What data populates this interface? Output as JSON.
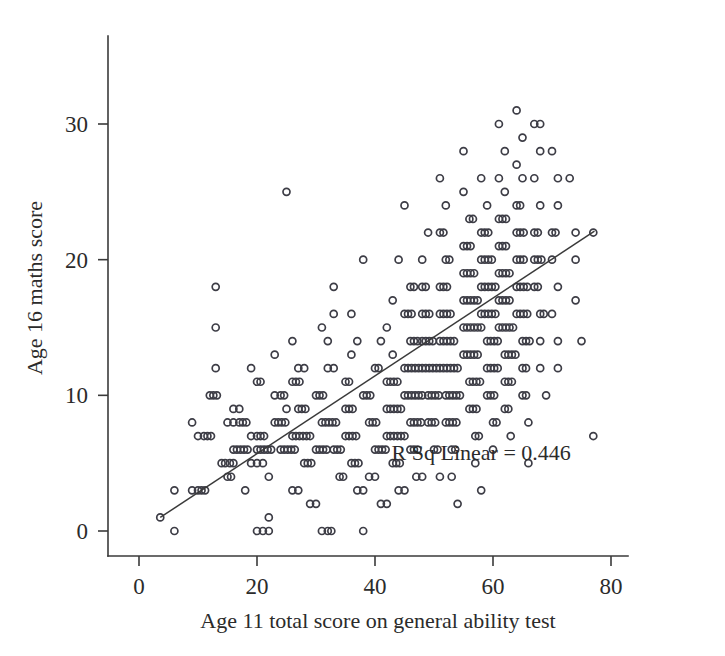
{
  "chart_data": {
    "type": "scatter",
    "title": "",
    "xlabel": "Age 11 total score on general ability test",
    "ylabel": "Age 16 maths score",
    "xlim": [
      -2,
      84
    ],
    "ylim": [
      -1.8,
      38
    ],
    "xticks": [
      0,
      20,
      40,
      60,
      80
    ],
    "xtick_labels": [
      "0",
      "20",
      "40",
      "60",
      "80"
    ],
    "yticks": [
      0,
      10,
      20,
      30
    ],
    "ytick_labels": [
      "0",
      "10",
      "20",
      "30"
    ],
    "grid": false,
    "legend": false,
    "marker": "open-circle",
    "marker_size": 7,
    "marker_color": "#3d3d46",
    "line_color": "#3a3a3a",
    "annotations": [
      {
        "text": "R Sq Linear = 0.446",
        "x": 58,
        "y": 5.2
      }
    ],
    "fit_line": {
      "type": "linear",
      "r_squared": 0.446,
      "x_start": 3.6,
      "y_start": 1.0,
      "x_end": 77.2,
      "y_end": 22.1
    },
    "points": [
      [
        3.6,
        1
      ],
      [
        6,
        0
      ],
      [
        6,
        3
      ],
      [
        9,
        3
      ],
      [
        10,
        3
      ],
      [
        10.6,
        3
      ],
      [
        11.2,
        3
      ],
      [
        13,
        18
      ],
      [
        13,
        15
      ],
      [
        9,
        8
      ],
      [
        10,
        7
      ],
      [
        11,
        7
      ],
      [
        11.6,
        7
      ],
      [
        12.2,
        7
      ],
      [
        12,
        10
      ],
      [
        12.6,
        10
      ],
      [
        13.2,
        10
      ],
      [
        13,
        12
      ],
      [
        14,
        5
      ],
      [
        14.6,
        5
      ],
      [
        15.4,
        5
      ],
      [
        16,
        5
      ],
      [
        15,
        4
      ],
      [
        15.6,
        4
      ],
      [
        16,
        6
      ],
      [
        16.6,
        6
      ],
      [
        17.2,
        6
      ],
      [
        17.8,
        6
      ],
      [
        18.4,
        6
      ],
      [
        15,
        8
      ],
      [
        16,
        8
      ],
      [
        17,
        8
      ],
      [
        17.6,
        8
      ],
      [
        18.2,
        8
      ],
      [
        16,
        9
      ],
      [
        17,
        9
      ],
      [
        20,
        0
      ],
      [
        21,
        0
      ],
      [
        22,
        0
      ],
      [
        19,
        12
      ],
      [
        20,
        11
      ],
      [
        20.6,
        11
      ],
      [
        20,
        6
      ],
      [
        20.6,
        6
      ],
      [
        21.2,
        6
      ],
      [
        21.8,
        6
      ],
      [
        22.4,
        6
      ],
      [
        19,
        7
      ],
      [
        20,
        7
      ],
      [
        20.6,
        7
      ],
      [
        21.2,
        7
      ],
      [
        19,
        5
      ],
      [
        20,
        5
      ],
      [
        21,
        5
      ],
      [
        18,
        3
      ],
      [
        22,
        1
      ],
      [
        22,
        4
      ],
      [
        23,
        8
      ],
      [
        23.6,
        8
      ],
      [
        24.2,
        8
      ],
      [
        24.8,
        8
      ],
      [
        23,
        10
      ],
      [
        24,
        10
      ],
      [
        24.6,
        10
      ],
      [
        25,
        9
      ],
      [
        24,
        6
      ],
      [
        24.6,
        6
      ],
      [
        25.2,
        6
      ],
      [
        25.8,
        6
      ],
      [
        26.4,
        6
      ],
      [
        23,
        13
      ],
      [
        25,
        25
      ],
      [
        26,
        14
      ],
      [
        27,
        12
      ],
      [
        28,
        12
      ],
      [
        26,
        7
      ],
      [
        26.6,
        7
      ],
      [
        27.2,
        7
      ],
      [
        27.8,
        7
      ],
      [
        28.4,
        7
      ],
      [
        29,
        7
      ],
      [
        26,
        11
      ],
      [
        26.6,
        11
      ],
      [
        27.2,
        11
      ],
      [
        27,
        9
      ],
      [
        27.6,
        9
      ],
      [
        28.2,
        9
      ],
      [
        28,
        5
      ],
      [
        28.6,
        5
      ],
      [
        29.2,
        5
      ],
      [
        26,
        3
      ],
      [
        27,
        3
      ],
      [
        29,
        2
      ],
      [
        30,
        2
      ],
      [
        31,
        0
      ],
      [
        32,
        0
      ],
      [
        32.6,
        0
      ],
      [
        33,
        18
      ],
      [
        31,
        15
      ],
      [
        32,
        14
      ],
      [
        33,
        16
      ],
      [
        30,
        10
      ],
      [
        30.6,
        10
      ],
      [
        31.2,
        10
      ],
      [
        31,
        8
      ],
      [
        31.6,
        8
      ],
      [
        32.2,
        8
      ],
      [
        32.8,
        8
      ],
      [
        33.4,
        8
      ],
      [
        30,
        6
      ],
      [
        30.6,
        6
      ],
      [
        31.2,
        6
      ],
      [
        31.8,
        6
      ],
      [
        32,
        12
      ],
      [
        33,
        12
      ],
      [
        33,
        6
      ],
      [
        33.6,
        6
      ],
      [
        34.2,
        6
      ],
      [
        34,
        4
      ],
      [
        34.6,
        4
      ],
      [
        35,
        9
      ],
      [
        35.6,
        9
      ],
      [
        36.2,
        9
      ],
      [
        35,
        7
      ],
      [
        35.6,
        7
      ],
      [
        36.2,
        7
      ],
      [
        36.8,
        7
      ],
      [
        35,
        11
      ],
      [
        35.6,
        11
      ],
      [
        36,
        13
      ],
      [
        37,
        14
      ],
      [
        36,
        16
      ],
      [
        38,
        20
      ],
      [
        36,
        5
      ],
      [
        36.6,
        5
      ],
      [
        37.2,
        5
      ],
      [
        37,
        3
      ],
      [
        38,
        3
      ],
      [
        38,
        0
      ],
      [
        38,
        10
      ],
      [
        38.6,
        10
      ],
      [
        39.2,
        10
      ],
      [
        39,
        8
      ],
      [
        39.6,
        8
      ],
      [
        40.2,
        8
      ],
      [
        40,
        12
      ],
      [
        40.6,
        12
      ],
      [
        41,
        14
      ],
      [
        40,
        6
      ],
      [
        40.6,
        6
      ],
      [
        41.2,
        6
      ],
      [
        41.8,
        6
      ],
      [
        39,
        4
      ],
      [
        40,
        4
      ],
      [
        41,
        2
      ],
      [
        42,
        2
      ],
      [
        43,
        17
      ],
      [
        42,
        15
      ],
      [
        43,
        13
      ],
      [
        42,
        11
      ],
      [
        42.6,
        11
      ],
      [
        43.2,
        11
      ],
      [
        43.8,
        11
      ],
      [
        42,
        9
      ],
      [
        42.6,
        9
      ],
      [
        43.2,
        9
      ],
      [
        43.8,
        9
      ],
      [
        44.4,
        9
      ],
      [
        42,
        7
      ],
      [
        42.6,
        7
      ],
      [
        43.2,
        7
      ],
      [
        43.8,
        7
      ],
      [
        44.4,
        7
      ],
      [
        45,
        7
      ],
      [
        43,
        5
      ],
      [
        43.6,
        5
      ],
      [
        44.2,
        5
      ],
      [
        44,
        3
      ],
      [
        45,
        3
      ],
      [
        44,
        20
      ],
      [
        45,
        24
      ],
      [
        46,
        18
      ],
      [
        46.6,
        18
      ],
      [
        45,
        16
      ],
      [
        45.6,
        16
      ],
      [
        46.2,
        16
      ],
      [
        46,
        14
      ],
      [
        46.6,
        14
      ],
      [
        47.2,
        14
      ],
      [
        45,
        12
      ],
      [
        45.6,
        12
      ],
      [
        46.2,
        12
      ],
      [
        46.8,
        12
      ],
      [
        47.4,
        12
      ],
      [
        45,
        10
      ],
      [
        45.6,
        10
      ],
      [
        46.2,
        10
      ],
      [
        46.8,
        10
      ],
      [
        47.4,
        10
      ],
      [
        48,
        10
      ],
      [
        46,
        8
      ],
      [
        46.6,
        8
      ],
      [
        47.2,
        8
      ],
      [
        47.8,
        8
      ],
      [
        46,
        6
      ],
      [
        46.6,
        6
      ],
      [
        47.2,
        6
      ],
      [
        47,
        4
      ],
      [
        48,
        4
      ],
      [
        48,
        20
      ],
      [
        49,
        22
      ],
      [
        48,
        18
      ],
      [
        48.6,
        18
      ],
      [
        48,
        16
      ],
      [
        48.6,
        16
      ],
      [
        49.2,
        16
      ],
      [
        48,
        14
      ],
      [
        48.6,
        14
      ],
      [
        49.2,
        14
      ],
      [
        49.8,
        14
      ],
      [
        48,
        12
      ],
      [
        48.6,
        12
      ],
      [
        49.2,
        12
      ],
      [
        49.8,
        12
      ],
      [
        50.4,
        12
      ],
      [
        49,
        10
      ],
      [
        49.6,
        10
      ],
      [
        50.2,
        10
      ],
      [
        50.8,
        10
      ],
      [
        49,
        8
      ],
      [
        49.6,
        8
      ],
      [
        50.2,
        8
      ],
      [
        50,
        6
      ],
      [
        50.6,
        6
      ],
      [
        51,
        4
      ],
      [
        51,
        26
      ],
      [
        52,
        24
      ],
      [
        51,
        22
      ],
      [
        51.6,
        22
      ],
      [
        52,
        20
      ],
      [
        52.6,
        20
      ],
      [
        51,
        18
      ],
      [
        51.6,
        18
      ],
      [
        52.2,
        18
      ],
      [
        51,
        16
      ],
      [
        51.6,
        16
      ],
      [
        52.2,
        16
      ],
      [
        52.8,
        16
      ],
      [
        51,
        14
      ],
      [
        51.6,
        14
      ],
      [
        52.2,
        14
      ],
      [
        52.8,
        14
      ],
      [
        53.4,
        14
      ],
      [
        51,
        12
      ],
      [
        51.6,
        12
      ],
      [
        52.2,
        12
      ],
      [
        52.8,
        12
      ],
      [
        53.4,
        12
      ],
      [
        54,
        12
      ],
      [
        52,
        10
      ],
      [
        52.6,
        10
      ],
      [
        53.2,
        10
      ],
      [
        53.8,
        10
      ],
      [
        54.4,
        10
      ],
      [
        52,
        8
      ],
      [
        52.6,
        8
      ],
      [
        53.2,
        8
      ],
      [
        53.8,
        8
      ],
      [
        53,
        6
      ],
      [
        53.6,
        6
      ],
      [
        53,
        4
      ],
      [
        54,
        2
      ],
      [
        55,
        28
      ],
      [
        55,
        25
      ],
      [
        56,
        23
      ],
      [
        56.6,
        23
      ],
      [
        55,
        21
      ],
      [
        55.6,
        21
      ],
      [
        56.2,
        21
      ],
      [
        55,
        19
      ],
      [
        55.6,
        19
      ],
      [
        56.2,
        19
      ],
      [
        56.8,
        19
      ],
      [
        55,
        17
      ],
      [
        55.6,
        17
      ],
      [
        56.2,
        17
      ],
      [
        56.8,
        17
      ],
      [
        57.4,
        17
      ],
      [
        55,
        15
      ],
      [
        55.6,
        15
      ],
      [
        56.2,
        15
      ],
      [
        56.8,
        15
      ],
      [
        57.4,
        15
      ],
      [
        58,
        15
      ],
      [
        55,
        13
      ],
      [
        55.6,
        13
      ],
      [
        56.2,
        13
      ],
      [
        56.8,
        13
      ],
      [
        57.4,
        13
      ],
      [
        56,
        11
      ],
      [
        56.6,
        11
      ],
      [
        57.2,
        11
      ],
      [
        57.8,
        11
      ],
      [
        56,
        9
      ],
      [
        56.6,
        9
      ],
      [
        57.2,
        9
      ],
      [
        57,
        7
      ],
      [
        57.6,
        7
      ],
      [
        57,
        5
      ],
      [
        58,
        3
      ],
      [
        58,
        26
      ],
      [
        59,
        24
      ],
      [
        58,
        22
      ],
      [
        58.6,
        22
      ],
      [
        59.2,
        22
      ],
      [
        58,
        20
      ],
      [
        58.6,
        20
      ],
      [
        59.2,
        20
      ],
      [
        59.8,
        20
      ],
      [
        58,
        18
      ],
      [
        58.6,
        18
      ],
      [
        59.2,
        18
      ],
      [
        59.8,
        18
      ],
      [
        60.4,
        18
      ],
      [
        58,
        16
      ],
      [
        58.6,
        16
      ],
      [
        59.2,
        16
      ],
      [
        59.8,
        16
      ],
      [
        60.4,
        16
      ],
      [
        59,
        14
      ],
      [
        59.6,
        14
      ],
      [
        60.2,
        14
      ],
      [
        60.8,
        14
      ],
      [
        59,
        12
      ],
      [
        59.6,
        12
      ],
      [
        60.2,
        12
      ],
      [
        60.8,
        12
      ],
      [
        59,
        10
      ],
      [
        59.6,
        10
      ],
      [
        60.2,
        10
      ],
      [
        60,
        8
      ],
      [
        60.6,
        8
      ],
      [
        60,
        6
      ],
      [
        61,
        30
      ],
      [
        62,
        28
      ],
      [
        61,
        26
      ],
      [
        62,
        25
      ],
      [
        61,
        23
      ],
      [
        61.6,
        23
      ],
      [
        62.2,
        23
      ],
      [
        61,
        21
      ],
      [
        61.6,
        21
      ],
      [
        62.2,
        21
      ],
      [
        61,
        19
      ],
      [
        61.6,
        19
      ],
      [
        62.2,
        19
      ],
      [
        62.8,
        19
      ],
      [
        61,
        17
      ],
      [
        61.6,
        17
      ],
      [
        62.2,
        17
      ],
      [
        62.8,
        17
      ],
      [
        61,
        15
      ],
      [
        61.6,
        15
      ],
      [
        62.2,
        15
      ],
      [
        62.8,
        15
      ],
      [
        63.4,
        15
      ],
      [
        62,
        13
      ],
      [
        62.6,
        13
      ],
      [
        63.2,
        13
      ],
      [
        63.8,
        13
      ],
      [
        62,
        11
      ],
      [
        62.6,
        11
      ],
      [
        63.2,
        11
      ],
      [
        62,
        9
      ],
      [
        62.6,
        9
      ],
      [
        63,
        7
      ],
      [
        64,
        31
      ],
      [
        65,
        29
      ],
      [
        64,
        27
      ],
      [
        65,
        26
      ],
      [
        64,
        24
      ],
      [
        64.6,
        24
      ],
      [
        64,
        22
      ],
      [
        64.6,
        22
      ],
      [
        65.2,
        22
      ],
      [
        64,
        20
      ],
      [
        64.6,
        20
      ],
      [
        65.2,
        20
      ],
      [
        64,
        18
      ],
      [
        64.6,
        18
      ],
      [
        65.2,
        18
      ],
      [
        65.8,
        18
      ],
      [
        64,
        16
      ],
      [
        64.6,
        16
      ],
      [
        65.2,
        16
      ],
      [
        65.8,
        16
      ],
      [
        65,
        14
      ],
      [
        65.6,
        14
      ],
      [
        66.2,
        14
      ],
      [
        65,
        12
      ],
      [
        65.6,
        12
      ],
      [
        65,
        10
      ],
      [
        65.6,
        10
      ],
      [
        66,
        8
      ],
      [
        66,
        5
      ],
      [
        67,
        30
      ],
      [
        68,
        30
      ],
      [
        68,
        28
      ],
      [
        67,
        26
      ],
      [
        68,
        24
      ],
      [
        67,
        22
      ],
      [
        67.6,
        22
      ],
      [
        67,
        20
      ],
      [
        67.6,
        20
      ],
      [
        68.2,
        20
      ],
      [
        67,
        18
      ],
      [
        67.6,
        18
      ],
      [
        68,
        16
      ],
      [
        68.6,
        16
      ],
      [
        68,
        14
      ],
      [
        68,
        12
      ],
      [
        69,
        10
      ],
      [
        70,
        28
      ],
      [
        71,
        26
      ],
      [
        71,
        24
      ],
      [
        70,
        22
      ],
      [
        70.6,
        22
      ],
      [
        70,
        20
      ],
      [
        71,
        18
      ],
      [
        70,
        16
      ],
      [
        71,
        14
      ],
      [
        71,
        12
      ],
      [
        73,
        26
      ],
      [
        74,
        22
      ],
      [
        74,
        20
      ],
      [
        74,
        17
      ],
      [
        75,
        14
      ],
      [
        77,
        22
      ],
      [
        77,
        7
      ]
    ]
  }
}
